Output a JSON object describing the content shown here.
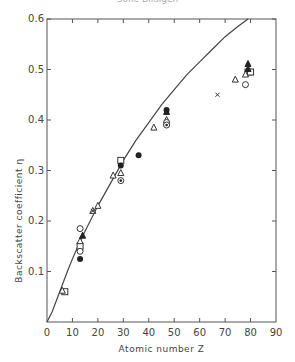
{
  "header": {
    "text": "Sofie Bildigen"
  },
  "chart_data": {
    "type": "scatter",
    "title": "",
    "xlabel": "Atomic number Z",
    "ylabel": "Backscatter coefficient η",
    "xlim": [
      0,
      90
    ],
    "ylim": [
      0,
      0.6
    ],
    "xticks": [
      0,
      10,
      20,
      30,
      40,
      50,
      60,
      70,
      80,
      90
    ],
    "yticks": [
      0.1,
      0.2,
      0.3,
      0.4,
      0.5,
      0.6
    ],
    "ytick_labels": [
      "0.1",
      "0.2",
      "0.3",
      "0.4",
      "0.5",
      "0.6"
    ],
    "grid": false,
    "curve": {
      "name": "theory",
      "x": [
        0,
        2,
        5,
        8,
        10,
        13,
        15,
        20,
        25,
        30,
        35,
        40,
        45,
        50,
        55,
        60,
        65,
        70,
        75,
        79
      ],
      "y": [
        0,
        0.02,
        0.06,
        0.1,
        0.125,
        0.16,
        0.18,
        0.23,
        0.275,
        0.32,
        0.36,
        0.395,
        0.43,
        0.46,
        0.49,
        0.515,
        0.54,
        0.565,
        0.585,
        0.6
      ]
    },
    "series": [
      {
        "name": "open square",
        "marker": "square-open",
        "points": [
          [
            7,
            0.06
          ],
          [
            13,
            0.15
          ],
          [
            29,
            0.32
          ],
          [
            79,
            0.495
          ],
          [
            80,
            0.495
          ]
        ]
      },
      {
        "name": "open triangle",
        "marker": "triangle-open",
        "points": [
          [
            6,
            0.062
          ],
          [
            13,
            0.16
          ],
          [
            18,
            0.22
          ],
          [
            20,
            0.23
          ],
          [
            26,
            0.29
          ],
          [
            29,
            0.295
          ],
          [
            42,
            0.385
          ],
          [
            47,
            0.4
          ],
          [
            74,
            0.48
          ],
          [
            78,
            0.49
          ]
        ]
      },
      {
        "name": "open circle",
        "marker": "circle-open",
        "points": [
          [
            13,
            0.185
          ],
          [
            13,
            0.14
          ],
          [
            47,
            0.395
          ],
          [
            78,
            0.47
          ]
        ]
      },
      {
        "name": "filled circle",
        "marker": "circle-filled",
        "points": [
          [
            13,
            0.125
          ],
          [
            29,
            0.31
          ],
          [
            36,
            0.33
          ],
          [
            47,
            0.42
          ]
        ]
      },
      {
        "name": "filled triangle",
        "marker": "triangle-filled",
        "points": [
          [
            14,
            0.17
          ],
          [
            47,
            0.415
          ],
          [
            79,
            0.51
          ],
          [
            79,
            0.5
          ]
        ]
      },
      {
        "name": "circle dot",
        "marker": "circle-dot",
        "points": [
          [
            29,
            0.28
          ],
          [
            47,
            0.39
          ]
        ]
      },
      {
        "name": "cross",
        "marker": "cross",
        "points": [
          [
            18,
            0.22
          ],
          [
            67,
            0.45
          ]
        ]
      }
    ]
  }
}
